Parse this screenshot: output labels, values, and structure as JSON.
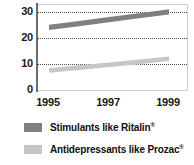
{
  "chart_data": {
    "type": "line",
    "title": "",
    "subtitle": "",
    "xlabel": "",
    "ylabel": "",
    "x": [
      1995,
      1996,
      1997,
      1998,
      1999
    ],
    "tick_labels_x": [
      "1995",
      "1997",
      "1999"
    ],
    "tick_values_x": [
      1995,
      1997,
      1999
    ],
    "tick_labels_y": [
      "30",
      "20",
      "10",
      "0"
    ],
    "tick_values_y": [
      30,
      20,
      10,
      0
    ],
    "xlim": [
      1994.6,
      1999.6
    ],
    "ylim": [
      0,
      33
    ],
    "grid": true,
    "grid_style": "dotted horizontal",
    "legend_position": "below",
    "series": [
      {
        "name": "Stimulants like Ritalin®",
        "color": "#808080",
        "style": "thick band",
        "values": [
          24.0,
          25.5,
          27.0,
          28.5,
          30.0
        ]
      },
      {
        "name": "Antidepressants like Prozac®",
        "color": "#c6c6c6",
        "style": "thick band",
        "values": [
          7.5,
          8.6,
          9.7,
          10.8,
          12.0
        ]
      }
    ]
  },
  "axes": {
    "y_ticks": [
      {
        "label": "30",
        "value": 30
      },
      {
        "label": "20",
        "value": 20
      },
      {
        "label": "10",
        "value": 10
      },
      {
        "label": "0",
        "value": 0
      }
    ],
    "x_ticks": [
      {
        "label": "1995",
        "value": 1995
      },
      {
        "label": "1997",
        "value": 1997
      },
      {
        "label": "1999",
        "value": 1999
      }
    ]
  },
  "legend": {
    "items": [
      {
        "label_main": "Stimulants like Ritalin",
        "label_mark": "®",
        "swatch_color": "#808080"
      },
      {
        "label_main": "Antidepressants like Prozac",
        "label_mark": "®",
        "swatch_color": "#c6c6c6"
      }
    ]
  },
  "colors": {
    "series_dark": "#808080",
    "series_light": "#c6c6c6",
    "axis": "#6d6d6d",
    "frame": "#cfcfcf",
    "grid": "#4a4a4a",
    "text": "#1a1a1a",
    "background": "#ffffff"
  }
}
